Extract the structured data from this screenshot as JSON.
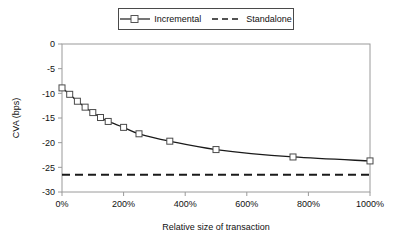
{
  "chart_data": {
    "type": "line",
    "title": "",
    "xlabel": "Relative size of transaction",
    "ylabel": "CVA (bps)",
    "xlim": [
      0,
      1000
    ],
    "ylim": [
      -30,
      0
    ],
    "xtick_labels": [
      "0%",
      "200%",
      "400%",
      "600%",
      "800%",
      "1000%"
    ],
    "xtick_values": [
      0,
      200,
      400,
      600,
      800,
      1000
    ],
    "ytick_labels": [
      "0",
      "-5",
      "-10",
      "-15",
      "-20",
      "-25",
      "-30"
    ],
    "ytick_values": [
      0,
      -5,
      -10,
      -15,
      -20,
      -25,
      -30
    ],
    "grid": false,
    "legend_position": "top-center",
    "series": [
      {
        "name": "Incremental",
        "style": "solid-with-square-markers",
        "color": "#1a1a1a",
        "x": [
          0,
          25,
          50,
          75,
          100,
          125,
          150,
          200,
          250,
          350,
          500,
          750,
          1000
        ],
        "values": [
          -8.9,
          -10.2,
          -11.6,
          -12.8,
          -13.9,
          -14.9,
          -15.7,
          -16.9,
          -18.2,
          -19.7,
          -21.4,
          -22.9,
          -23.7
        ]
      },
      {
        "name": "Standalone",
        "style": "dashed",
        "color": "#1a1a1a",
        "x": [
          0,
          1000
        ],
        "values": [
          -26.5,
          -26.5
        ]
      }
    ]
  },
  "legend": {
    "items": [
      {
        "label": "Incremental",
        "marker": "open-square",
        "line": "solid"
      },
      {
        "label": "Standalone",
        "marker": "none",
        "line": "dashed"
      }
    ]
  },
  "axes": {
    "x_title": "Relative size of transaction",
    "y_title": "CVA (bps)"
  }
}
